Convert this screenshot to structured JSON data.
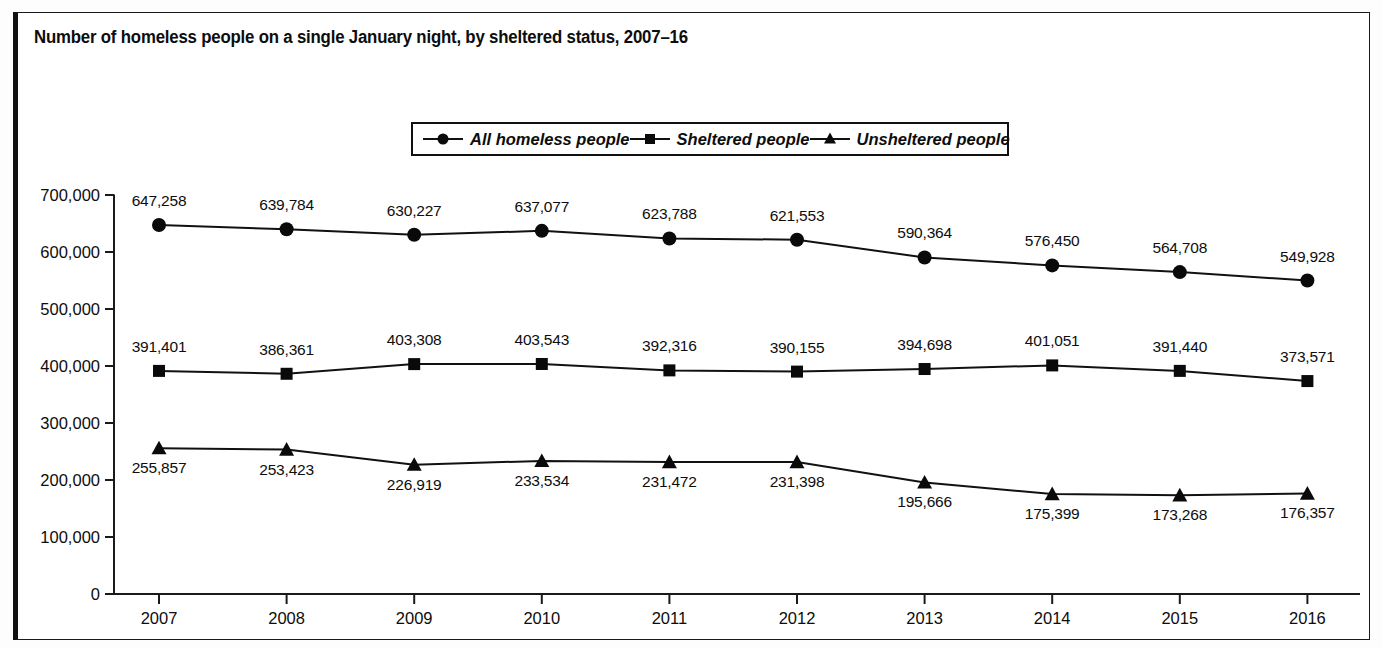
{
  "title": "Number of homeless people on a single January night, by sheltered status, 2007–16",
  "legend": {
    "items": [
      {
        "label": "All homeless people",
        "marker": "circle"
      },
      {
        "label": "Sheltered people",
        "marker": "square"
      },
      {
        "label": "Unsheltered people",
        "marker": "triangle"
      }
    ]
  },
  "axis": {
    "y_ticks": [
      "700,000",
      "600,000",
      "500,000",
      "400,000",
      "300,000",
      "200,000",
      "100,000",
      "0"
    ],
    "x_ticks": [
      "2007",
      "2008",
      "2009",
      "2010",
      "2011",
      "2012",
      "2013",
      "2014",
      "2015",
      "2016"
    ]
  },
  "colors": {
    "line": "#111111",
    "marker": "#0a0a0a",
    "axis": "#1a1a1a",
    "background": "#ffffff"
  },
  "chart_data": {
    "type": "line",
    "title": "Number of homeless people on a single January night, by sheltered status, 2007–16",
    "xlabel": "",
    "ylabel": "",
    "x": [
      2007,
      2008,
      2009,
      2010,
      2011,
      2012,
      2013,
      2014,
      2015,
      2016
    ],
    "categories": [
      "2007",
      "2008",
      "2009",
      "2010",
      "2011",
      "2012",
      "2013",
      "2014",
      "2015",
      "2016"
    ],
    "ylim": [
      0,
      700000
    ],
    "ytick_values": [
      0,
      100000,
      200000,
      300000,
      400000,
      500000,
      600000,
      700000
    ],
    "grid": false,
    "legend_position": "top-center",
    "series": [
      {
        "name": "All homeless people",
        "marker": "circle",
        "values": [
          647258,
          639784,
          630227,
          637077,
          623788,
          621553,
          590364,
          576450,
          564708,
          549928
        ],
        "labels": [
          "647,258",
          "639,784",
          "630,227",
          "637,077",
          "623,788",
          "621,553",
          "590,364",
          "576,450",
          "564,708",
          "549,928"
        ],
        "label_positions": [
          "above",
          "above",
          "above",
          "above",
          "above",
          "above",
          "above",
          "above",
          "above",
          "above"
        ]
      },
      {
        "name": "Sheltered people",
        "marker": "square",
        "values": [
          391401,
          386361,
          403308,
          403543,
          392316,
          390155,
          394698,
          401051,
          391440,
          373571
        ],
        "labels": [
          "391,401",
          "386,361",
          "403,308",
          "403,543",
          "392,316",
          "390,155",
          "394,698",
          "401,051",
          "391,440",
          "373,571"
        ],
        "label_positions": [
          "above",
          "above",
          "above",
          "above",
          "above",
          "above",
          "above",
          "above",
          "above",
          "above"
        ]
      },
      {
        "name": "Unsheltered people",
        "marker": "triangle",
        "values": [
          255857,
          253423,
          226919,
          233534,
          231472,
          231398,
          195666,
          175399,
          173268,
          176357
        ],
        "labels": [
          "255,857",
          "253,423",
          "226,919",
          "233,534",
          "231,472",
          "231,398",
          "195,666",
          "175,399",
          "173,268",
          "176,357"
        ],
        "label_positions": [
          "below",
          "below",
          "below",
          "below",
          "below",
          "below",
          "below",
          "below",
          "below",
          "below"
        ]
      }
    ]
  }
}
